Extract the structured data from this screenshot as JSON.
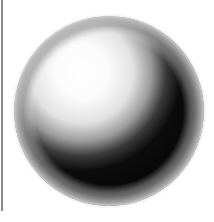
{
  "figure": {
    "sphere": {
      "cx": 109,
      "cy": 111,
      "r": 95
    },
    "highlight": {
      "cx": 82,
      "cy": 72
    },
    "colors": {
      "background": "#ffffff",
      "highlight": "#ffffff",
      "midtone": "#b8b8b8",
      "core_shadow": "#0a0a0a",
      "reflected_light": "#9a9a9a",
      "rim": "#c8c8c8",
      "left_rule": "#8a8a8a"
    }
  }
}
